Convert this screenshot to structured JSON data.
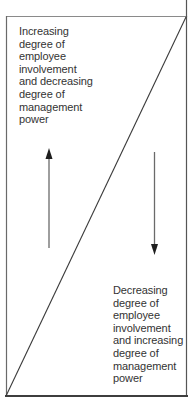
{
  "diagram": {
    "type": "continuum",
    "top_left_label": "Increasing\ndegree of\nemployee\ninvolvement\nand decreasing\ndegree of\nmanagement\npower",
    "bottom_right_label": "Decreasing\ndegree of\nemployee\ninvolvement\nand increasing\ndegree of\nmanagement\npower",
    "arrows": [
      {
        "name": "up-arrow",
        "direction": "up",
        "meaning": "towards employee involvement"
      },
      {
        "name": "down-arrow",
        "direction": "down",
        "meaning": "towards management power"
      }
    ],
    "divider": "diagonal line from bottom-left to top-right",
    "colors": {
      "line": "#3a3a3a",
      "border": "#555555",
      "text": "#333333",
      "background": "#ffffff"
    }
  }
}
